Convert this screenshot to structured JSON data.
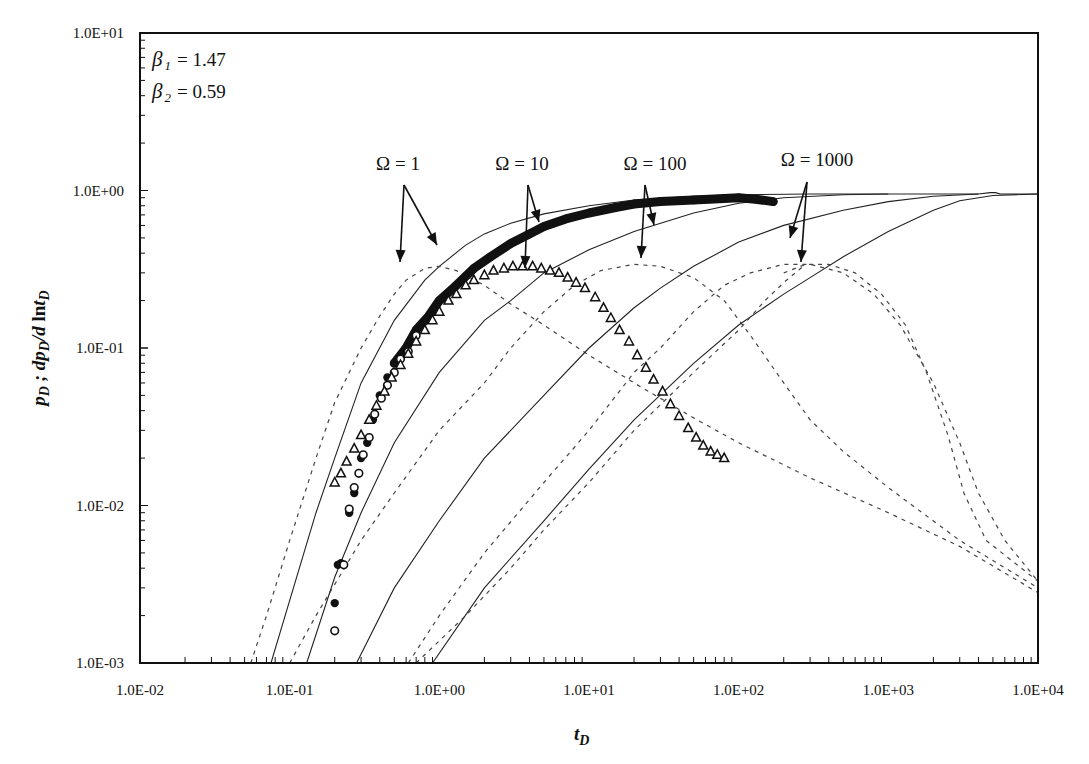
{
  "chart_data": {
    "type": "line",
    "title": "",
    "xlabel": "t_D",
    "ylabel": "p_D ; dp_D / d ln t_D",
    "xscale": "log",
    "yscale": "log",
    "xlim": [
      0.01,
      10000
    ],
    "ylim": [
      0.001,
      10
    ],
    "grid": false,
    "x_tick_labels": [
      "1.0E-02",
      "1.0E-01",
      "1.0E+00",
      "1.0E+01",
      "1.0E+02",
      "1.0E+03",
      "1.0E+04"
    ],
    "y_tick_labels": [
      "1.0E-03",
      "1.0E-02",
      "1.0E-01",
      "1.0E+00",
      "1.0E+01"
    ],
    "parameters": [
      {
        "symbol": "β",
        "subscript": "1",
        "value": "= 1.47"
      },
      {
        "symbol": "β",
        "subscript": "2",
        "value": "= 0.59"
      }
    ],
    "annotations": [
      {
        "text": "Ω = 1",
        "x_px": 398,
        "y_px": 170,
        "arrows": [
          [
            404,
            185,
            400,
            262
          ],
          [
            404,
            185,
            437,
            245
          ]
        ]
      },
      {
        "text": "Ω = 10",
        "x_px": 522,
        "y_px": 170,
        "arrows": [
          [
            528,
            185,
            525,
            268
          ],
          [
            528,
            185,
            539,
            222
          ]
        ]
      },
      {
        "text": "Ω = 100",
        "x_px": 655,
        "y_px": 170,
        "arrows": [
          [
            645,
            185,
            641,
            258
          ],
          [
            645,
            185,
            654,
            225
          ]
        ]
      },
      {
        "text": "Ω = 1000",
        "x_px": 817,
        "y_px": 166,
        "arrows": [
          [
            807,
            182,
            790,
            238
          ],
          [
            807,
            182,
            801,
            262
          ]
        ]
      }
    ],
    "series": [
      {
        "name": "Ω=1 p_D",
        "style": "solid",
        "points": [
          [
            0.075,
            0.001
          ],
          [
            0.1,
            0.0025
          ],
          [
            0.15,
            0.009
          ],
          [
            0.2,
            0.02
          ],
          [
            0.3,
            0.06
          ],
          [
            0.5,
            0.15
          ],
          [
            0.8,
            0.27
          ],
          [
            1.0,
            0.33
          ],
          [
            1.5,
            0.45
          ],
          [
            2,
            0.53
          ],
          [
            3,
            0.62
          ],
          [
            5,
            0.71
          ],
          [
            10,
            0.8
          ],
          [
            20,
            0.87
          ],
          [
            50,
            0.92
          ],
          [
            100,
            0.94
          ],
          [
            300,
            0.95
          ],
          [
            1000,
            0.95
          ],
          [
            4000,
            0.95
          ],
          [
            4800,
            0.97
          ],
          [
            5200,
            0.97
          ],
          [
            5600,
            0.95
          ],
          [
            10000,
            0.95
          ]
        ]
      },
      {
        "name": "Ω=1 dp_D/dlnt_D",
        "style": "dashed",
        "points": [
          [
            0.055,
            0.001
          ],
          [
            0.07,
            0.002
          ],
          [
            0.1,
            0.006
          ],
          [
            0.15,
            0.02
          ],
          [
            0.2,
            0.045
          ],
          [
            0.3,
            0.1
          ],
          [
            0.4,
            0.16
          ],
          [
            0.5,
            0.22
          ],
          [
            0.6,
            0.27
          ],
          [
            0.8,
            0.32
          ],
          [
            1.0,
            0.33
          ],
          [
            1.3,
            0.31
          ],
          [
            2,
            0.25
          ],
          [
            3,
            0.19
          ],
          [
            5,
            0.14
          ],
          [
            10,
            0.09
          ],
          [
            20,
            0.06
          ],
          [
            50,
            0.036
          ],
          [
            100,
            0.025
          ],
          [
            300,
            0.015
          ],
          [
            1000,
            0.009
          ],
          [
            3000,
            0.0055
          ],
          [
            10000,
            0.0028
          ]
        ]
      },
      {
        "name": "Ω=10 p_D",
        "style": "solid",
        "points": [
          [
            0.13,
            0.001
          ],
          [
            0.2,
            0.0035
          ],
          [
            0.3,
            0.009
          ],
          [
            0.5,
            0.025
          ],
          [
            1,
            0.07
          ],
          [
            2,
            0.15
          ],
          [
            3,
            0.2
          ],
          [
            5,
            0.3
          ],
          [
            10,
            0.42
          ],
          [
            20,
            0.55
          ],
          [
            50,
            0.72
          ],
          [
            100,
            0.83
          ],
          [
            200,
            0.9
          ],
          [
            500,
            0.94
          ],
          [
            1000,
            0.95
          ]
        ]
      },
      {
        "name": "Ω=10 dp_D/dlnt_D",
        "style": "dashed",
        "points": [
          [
            0.1,
            0.001
          ],
          [
            0.15,
            0.002
          ],
          [
            0.3,
            0.006
          ],
          [
            0.5,
            0.012
          ],
          [
            1,
            0.03
          ],
          [
            2,
            0.06
          ],
          [
            3,
            0.1
          ],
          [
            5,
            0.17
          ],
          [
            8,
            0.25
          ],
          [
            12,
            0.31
          ],
          [
            20,
            0.34
          ],
          [
            30,
            0.33
          ],
          [
            50,
            0.28
          ],
          [
            80,
            0.2
          ],
          [
            120,
            0.12
          ],
          [
            200,
            0.06
          ],
          [
            300,
            0.035
          ],
          [
            500,
            0.022
          ],
          [
            1000,
            0.013
          ],
          [
            3000,
            0.006
          ],
          [
            10000,
            0.003
          ]
        ]
      },
      {
        "name": "Ω=100 p_D",
        "style": "solid",
        "points": [
          [
            0.28,
            0.001
          ],
          [
            0.5,
            0.003
          ],
          [
            1,
            0.008
          ],
          [
            2,
            0.02
          ],
          [
            5,
            0.05
          ],
          [
            10,
            0.1
          ],
          [
            20,
            0.18
          ],
          [
            30,
            0.24
          ],
          [
            50,
            0.33
          ],
          [
            100,
            0.47
          ],
          [
            200,
            0.6
          ],
          [
            500,
            0.75
          ],
          [
            1000,
            0.85
          ],
          [
            2000,
            0.92
          ],
          [
            4000,
            0.95
          ]
        ]
      },
      {
        "name": "Ω=100 dp_D/dlnt_D",
        "style": "dashed",
        "points": [
          [
            0.62,
            0.001
          ],
          [
            1,
            0.002
          ],
          [
            2,
            0.005
          ],
          [
            5,
            0.014
          ],
          [
            10,
            0.03
          ],
          [
            20,
            0.07
          ],
          [
            30,
            0.1
          ],
          [
            50,
            0.17
          ],
          [
            80,
            0.25
          ],
          [
            120,
            0.3
          ],
          [
            200,
            0.34
          ],
          [
            300,
            0.34
          ],
          [
            500,
            0.3
          ],
          [
            800,
            0.22
          ],
          [
            1200,
            0.14
          ],
          [
            2000,
            0.06
          ],
          [
            3000,
            0.025
          ],
          [
            4000,
            0.012
          ],
          [
            6000,
            0.006
          ],
          [
            10000,
            0.0033
          ]
        ]
      },
      {
        "name": "Ω=1000 p_D",
        "style": "solid",
        "points": [
          [
            0.9,
            0.001
          ],
          [
            2,
            0.003
          ],
          [
            5,
            0.008
          ],
          [
            10,
            0.017
          ],
          [
            20,
            0.035
          ],
          [
            50,
            0.08
          ],
          [
            100,
            0.14
          ],
          [
            200,
            0.22
          ],
          [
            300,
            0.28
          ],
          [
            500,
            0.38
          ],
          [
            1000,
            0.55
          ],
          [
            2000,
            0.75
          ],
          [
            3000,
            0.86
          ],
          [
            5000,
            0.93
          ],
          [
            10000,
            0.95
          ]
        ]
      },
      {
        "name": "Ω=1000 dp_D/dlnt_D (late)",
        "style": "dashed",
        "points": [
          [
            200,
            0.3
          ],
          [
            280,
            0.34
          ],
          [
            400,
            0.34
          ],
          [
            600,
            0.3
          ],
          [
            900,
            0.22
          ],
          [
            1300,
            0.14
          ],
          [
            1800,
            0.07
          ],
          [
            2500,
            0.028
          ],
          [
            3200,
            0.012
          ],
          [
            4500,
            0.006
          ],
          [
            10000,
            0.0033
          ]
        ]
      },
      {
        "name": "Ω=1000 dp_D/dlnt_D (early)",
        "style": "dashed",
        "points": [
          [
            0.7,
            0.001
          ],
          [
            1.5,
            0.002
          ],
          [
            3,
            0.004
          ],
          [
            5,
            0.007
          ],
          [
            10,
            0.014
          ],
          [
            20,
            0.03
          ],
          [
            50,
            0.07
          ],
          [
            100,
            0.13
          ],
          [
            150,
            0.2
          ],
          [
            200,
            0.26
          ],
          [
            280,
            0.34
          ]
        ]
      }
    ],
    "markers": [
      {
        "name": "field data p_D (filled circles)",
        "marker": "filled-circle",
        "points": [
          [
            0.2,
            0.0024
          ],
          [
            0.21,
            0.0042
          ],
          [
            0.22,
            0.0043
          ],
          [
            0.25,
            0.009
          ],
          [
            0.27,
            0.012
          ],
          [
            0.3,
            0.02
          ],
          [
            0.33,
            0.025
          ],
          [
            0.36,
            0.035
          ],
          [
            0.4,
            0.05
          ],
          [
            0.45,
            0.065
          ],
          [
            0.5,
            0.08
          ],
          [
            0.6,
            0.1
          ],
          [
            0.7,
            0.13
          ],
          [
            0.85,
            0.16
          ],
          [
            1,
            0.2
          ],
          [
            1.3,
            0.25
          ],
          [
            1.7,
            0.32
          ],
          [
            2.2,
            0.38
          ],
          [
            3,
            0.46
          ],
          [
            4,
            0.53
          ],
          [
            5,
            0.59
          ],
          [
            7,
            0.66
          ],
          [
            10,
            0.72
          ],
          [
            15,
            0.78
          ],
          [
            20,
            0.82
          ],
          [
            30,
            0.85
          ],
          [
            50,
            0.87
          ],
          [
            80,
            0.89
          ],
          [
            100,
            0.9
          ],
          [
            130,
            0.88
          ],
          [
            170,
            0.85
          ]
        ]
      },
      {
        "name": "field data p_D (open circles)",
        "marker": "open-circle",
        "points": [
          [
            0.2,
            0.0016
          ],
          [
            0.23,
            0.0042
          ],
          [
            0.25,
            0.0095
          ],
          [
            0.27,
            0.013
          ],
          [
            0.29,
            0.016
          ],
          [
            0.31,
            0.021
          ],
          [
            0.34,
            0.027
          ],
          [
            0.37,
            0.038
          ],
          [
            0.41,
            0.048
          ],
          [
            0.45,
            0.058
          ],
          [
            0.5,
            0.07
          ],
          [
            0.55,
            0.085
          ],
          [
            0.62,
            0.095
          ],
          [
            0.7,
            0.12
          ]
        ]
      },
      {
        "name": "field data dp_D/dlnt_D (triangles)",
        "marker": "triangle",
        "points": [
          [
            0.2,
            0.014
          ],
          [
            0.22,
            0.016
          ],
          [
            0.24,
            0.019
          ],
          [
            0.27,
            0.023
          ],
          [
            0.3,
            0.028
          ],
          [
            0.34,
            0.035
          ],
          [
            0.38,
            0.043
          ],
          [
            0.43,
            0.053
          ],
          [
            0.48,
            0.065
          ],
          [
            0.55,
            0.078
          ],
          [
            0.62,
            0.092
          ],
          [
            0.7,
            0.11
          ],
          [
            0.8,
            0.13
          ],
          [
            0.9,
            0.15
          ],
          [
            1.0,
            0.17
          ],
          [
            1.15,
            0.2
          ],
          [
            1.3,
            0.22
          ],
          [
            1.5,
            0.25
          ],
          [
            1.7,
            0.27
          ],
          [
            2.0,
            0.29
          ],
          [
            2.3,
            0.31
          ],
          [
            2.7,
            0.32
          ],
          [
            3.1,
            0.33
          ],
          [
            3.6,
            0.33
          ],
          [
            4.2,
            0.33
          ],
          [
            4.8,
            0.32
          ],
          [
            5.5,
            0.31
          ],
          [
            6.3,
            0.3
          ],
          [
            7.2,
            0.28
          ],
          [
            8.2,
            0.26
          ],
          [
            9.4,
            0.24
          ],
          [
            11,
            0.21
          ],
          [
            12.5,
            0.18
          ],
          [
            14,
            0.155
          ],
          [
            16,
            0.13
          ],
          [
            18.5,
            0.11
          ],
          [
            21,
            0.09
          ],
          [
            24,
            0.075
          ],
          [
            27,
            0.063
          ],
          [
            31,
            0.053
          ],
          [
            35,
            0.044
          ],
          [
            40,
            0.037
          ],
          [
            46,
            0.031
          ],
          [
            52,
            0.027
          ],
          [
            58,
            0.024
          ],
          [
            65,
            0.022
          ],
          [
            72,
            0.021
          ],
          [
            80,
            0.02
          ]
        ]
      }
    ]
  },
  "axes": {
    "x_title_main": "t",
    "x_title_sub": "D",
    "y_title": "p D ; dp D /d lnt D"
  }
}
